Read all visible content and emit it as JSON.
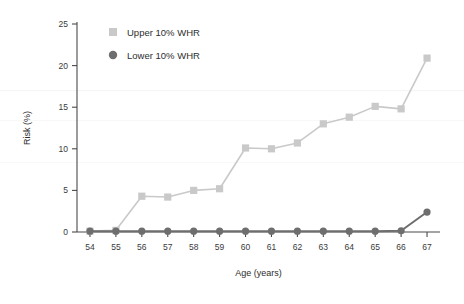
{
  "chart_data": {
    "type": "line",
    "title": "",
    "xlabel": "Age (years)",
    "ylabel": "Risk (%)",
    "x": [
      54,
      55,
      56,
      57,
      58,
      59,
      60,
      61,
      62,
      63,
      64,
      65,
      66,
      67
    ],
    "categories": [
      "54",
      "55",
      "56",
      "57",
      "58",
      "59",
      "60",
      "61",
      "62",
      "63",
      "64",
      "65",
      "66",
      "67"
    ],
    "xlim": [
      53.5,
      67.5
    ],
    "ylim": [
      0,
      25
    ],
    "yticks": [
      0,
      5,
      10,
      15,
      20,
      25
    ],
    "ytick_labels": [
      "0",
      "5",
      "10",
      "15",
      "20",
      "25"
    ],
    "grid": false,
    "legend_position": "top-left-inside",
    "series": [
      {
        "name": "Upper 10% WHR",
        "marker": "square",
        "color": "#c9c9c9",
        "values": [
          0.1,
          0.2,
          4.3,
          4.2,
          5.0,
          5.2,
          10.1,
          10.0,
          10.7,
          13.0,
          13.8,
          15.1,
          14.8,
          20.9
        ]
      },
      {
        "name": "Lower 10% WHR",
        "marker": "circle",
        "color": "#6e6e6e",
        "values": [
          0.1,
          0.1,
          0.1,
          0.1,
          0.1,
          0.1,
          0.1,
          0.1,
          0.1,
          0.1,
          0.1,
          0.1,
          0.15,
          2.4
        ]
      }
    ]
  },
  "legend": {
    "items": [
      {
        "label": "Upper 10% WHR",
        "marker": "square",
        "color": "#c9c9c9"
      },
      {
        "label": "Lower 10% WHR",
        "marker": "circle",
        "color": "#6e6e6e"
      }
    ]
  },
  "axes": {
    "x_title": "Age (years)",
    "y_title": "Risk (%)"
  },
  "colors": {
    "upper_series": "#c9c9c9",
    "lower_series": "#6e6e6e",
    "axis": "#4a4a4a",
    "text": "#2e2e2e",
    "background": "#ffffff"
  }
}
